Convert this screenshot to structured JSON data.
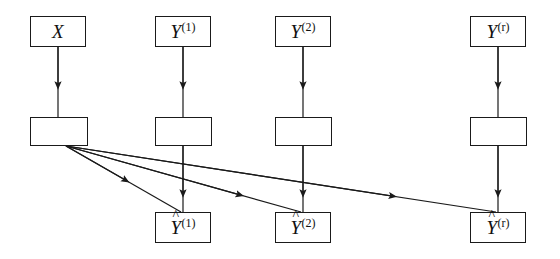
{
  "figure": {
    "kind": "flow-diagram",
    "background_color": "#ffffff",
    "stroke_color": "#1a1a1a",
    "width": 560,
    "height": 259
  },
  "nodes": {
    "input": {
      "id": "X",
      "label_base": "X",
      "label_sup": "",
      "hat": false,
      "x": 30,
      "y": 16,
      "w": 56,
      "h": 31
    },
    "targets": [
      {
        "id": "Y1",
        "label_base": "Y",
        "label_sup": "(1)",
        "hat": false,
        "x": 155,
        "y": 16,
        "w": 56,
        "h": 31
      },
      {
        "id": "Y2",
        "label_base": "Y",
        "label_sup": "(2)",
        "hat": false,
        "x": 275,
        "y": 16,
        "w": 56,
        "h": 31
      },
      {
        "id": "Yr",
        "label_base": "Y",
        "label_sup": "(r)",
        "hat": false,
        "x": 470,
        "y": 16,
        "w": 56,
        "h": 31
      }
    ],
    "processors": [
      {
        "id": "P0",
        "label_base": "",
        "label_sup": "",
        "hat": false,
        "x": 30,
        "y": 117,
        "w": 58,
        "h": 29
      },
      {
        "id": "P1",
        "label_base": "",
        "label_sup": "",
        "hat": false,
        "x": 155,
        "y": 117,
        "w": 57,
        "h": 29
      },
      {
        "id": "P2",
        "label_base": "",
        "label_sup": "",
        "hat": false,
        "x": 275,
        "y": 117,
        "w": 57,
        "h": 29
      },
      {
        "id": "Pr",
        "label_base": "",
        "label_sup": "",
        "hat": false,
        "x": 470,
        "y": 117,
        "w": 57,
        "h": 29
      }
    ],
    "predictions": [
      {
        "id": "Yhat1",
        "label_base": "Y",
        "label_sup": "(1)",
        "hat": true,
        "x": 155,
        "y": 212,
        "w": 56,
        "h": 31
      },
      {
        "id": "Yhat2",
        "label_base": "Y",
        "label_sup": "(2)",
        "hat": true,
        "x": 275,
        "y": 212,
        "w": 56,
        "h": 31
      },
      {
        "id": "Yhatr",
        "label_base": "Y",
        "label_sup": "(r)",
        "hat": true,
        "x": 470,
        "y": 212,
        "w": 56,
        "h": 31
      }
    ]
  },
  "edges": {
    "vertical_top": [
      {
        "name": "X-to-P0",
        "x": 58,
        "y1": 47,
        "y2": 117
      },
      {
        "name": "Y1-to-P1",
        "x": 183,
        "y1": 47,
        "y2": 117
      },
      {
        "name": "Y2-to-P2",
        "x": 303,
        "y1": 47,
        "y2": 117
      },
      {
        "name": "Yr-to-Pr",
        "x": 498,
        "y1": 47,
        "y2": 117
      }
    ],
    "vertical_bottom": [
      {
        "name": "P1-to-Yhat1",
        "x": 183,
        "y1": 146,
        "y2": 212
      },
      {
        "name": "P2-to-Yhat2",
        "x": 303,
        "y1": 146,
        "y2": 212
      },
      {
        "name": "Pr-to-Yhatr",
        "x": 498,
        "y1": 146,
        "y2": 212
      }
    ],
    "diagonals": [
      {
        "name": "P0-to-Yhat1",
        "x1": 66,
        "y1": 146,
        "x2": 181,
        "y2": 212,
        "arrow_at": 0.52
      },
      {
        "name": "P0-to-Yhat2",
        "x1": 66,
        "y1": 146,
        "x2": 301,
        "y2": 212,
        "arrow_at": 0.74
      },
      {
        "name": "P0-to-Yhatr",
        "x1": 66,
        "y1": 146,
        "x2": 496,
        "y2": 212,
        "arrow_at": 0.76
      }
    ]
  },
  "glyphs": {
    "hat": "^",
    "arrowhead": "filled-triangle"
  }
}
